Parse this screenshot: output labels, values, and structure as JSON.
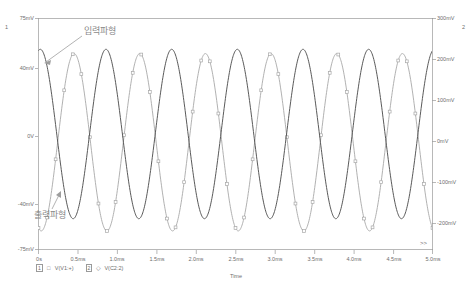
{
  "window": {
    "type": "pspice-probe-plot",
    "background": "#ffffff",
    "frame_color": "#9a9a9a"
  },
  "chart_data": {
    "type": "line",
    "title": "",
    "subtitle": "",
    "xlabel": "Time",
    "ylabel": "",
    "grid": false,
    "legend_position": "bottom-left",
    "axes": {
      "x": {
        "min_label": "0s",
        "max_label": "5.0ms",
        "unit": "ms",
        "min": 0,
        "max": 5.0,
        "ticks": [
          "0s",
          "0.5ms",
          "1.0ms",
          "1.5ms",
          "2.0ms",
          "2.5ms",
          "3.0ms",
          "3.5ms",
          "4.0ms",
          "4.5ms",
          "5.0ms"
        ],
        "tick_values": [
          0,
          0.5,
          1.0,
          1.5,
          2.0,
          2.5,
          3.0,
          3.5,
          4.0,
          4.5,
          5.0
        ]
      },
      "y_left": {
        "index": "1",
        "unit": "V",
        "ticks": [
          "75mV",
          "40mV",
          "0V",
          "-40mV",
          "-75mV"
        ],
        "tick_values": [
          75,
          40,
          0,
          -40,
          -75
        ],
        "min": -75,
        "max": 75,
        "color": "#6e6e6e"
      },
      "y_right": {
        "index": "2",
        "unit": "V",
        "ticks": [
          "300mV",
          "200mV",
          "100mV",
          "0mV",
          "-100mV",
          "-200mV"
        ],
        "tick_values": [
          300,
          200,
          100,
          0,
          -100,
          -200
        ],
        "min": -260,
        "max": 300,
        "color": "#6e6e6e"
      }
    },
    "series": [
      {
        "name": "V(V1:+)",
        "trace_number": "1",
        "axis": "y_left",
        "color": "#555555",
        "marker": "none",
        "line_width": 1,
        "description": "output waveform trace, darker solid sine",
        "waveform": {
          "shape": "sine",
          "amplitude_mv": 55,
          "offset_mv": 0,
          "frequency_khz": 1.2,
          "phase_deg": 80,
          "cycles": 6
        }
      },
      {
        "name": "V(C2:2)",
        "trace_number": "2",
        "axis": "y_right",
        "color": "#a8a8a8",
        "marker": "square",
        "line_width": 1,
        "description": "input waveform trace, light gray sine with square markers",
        "waveform": {
          "shape": "sine",
          "amplitude_mv": 215,
          "offset_mv": 0,
          "frequency_khz": 1.2,
          "phase_deg": 255,
          "cycles": 6
        }
      }
    ],
    "annotations": [
      {
        "text": "입력파형",
        "meaning": "input waveform",
        "x_px": 84,
        "y_px": 30,
        "arrow_to_x_px": 44,
        "arrow_to_y_px": 63,
        "color": "#8a8a8a"
      },
      {
        "text": "출력파형",
        "meaning": "output waveform",
        "x_px": 36,
        "y_px": 215,
        "arrow_to_x_px": 58,
        "arrow_to_y_px": 192,
        "color": "#8a8a8a"
      }
    ]
  },
  "legend": {
    "items": [
      {
        "box": "1",
        "symbol": "□",
        "label": "V(V1:+)"
      },
      {
        "box": "2",
        "symbol": "◇",
        "label": "V(C2:2)"
      }
    ]
  },
  "markers": {
    "scroll_right": ">>"
  }
}
